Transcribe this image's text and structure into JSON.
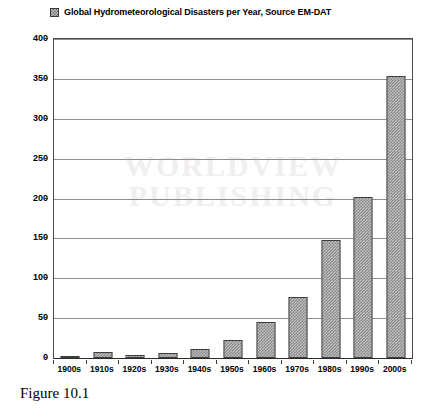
{
  "chart_data": {
    "type": "bar",
    "title": "Global Hydrometeorological Disasters per Year, Source EM-DAT",
    "xlabel": "",
    "ylabel": "",
    "ylim": [
      0,
      400
    ],
    "ytick_step": 50,
    "yticks": [
      "400",
      "350",
      "300",
      "250",
      "200",
      "150",
      "100",
      "50",
      "0"
    ],
    "grid": true,
    "legend_position": "top",
    "legend_entries": [
      "Global Hydrometeorological Disasters per Year, Source EM-DAT"
    ],
    "categories": [
      "1900s",
      "1910s",
      "1920s",
      "1930s",
      "1940s",
      "1950s",
      "1960s",
      "1970s",
      "1980s",
      "1990s",
      "2000s"
    ],
    "values": [
      2,
      8,
      4,
      6,
      11,
      23,
      45,
      76,
      148,
      202,
      353
    ],
    "series": [
      {
        "name": "Global Hydrometeorological Disasters per Year, Source EM-DAT",
        "values": [
          2,
          8,
          4,
          6,
          11,
          23,
          45,
          76,
          148,
          202,
          353
        ]
      }
    ]
  },
  "legend": {
    "swatch_icon": "hatched-square-icon",
    "label": "Global Hydrometeorological Disasters per Year, Source EM-DAT"
  },
  "watermark": {
    "line1": "WORLDVIEW",
    "line2": "PUBLISHING"
  },
  "caption": {
    "text": "Figure 10.1"
  },
  "colors": {
    "bar_fill": "#c2c2c2",
    "bar_hatch": "#777777",
    "bar_border": "#3d3d3d",
    "gridline": "#8d8d8d",
    "axis": "#3a3a3a",
    "text": "#000000",
    "background": "#ffffff",
    "watermark": "#f1eeee"
  }
}
